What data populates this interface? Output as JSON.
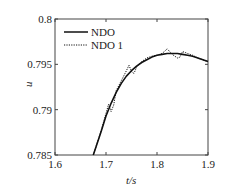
{
  "chart_data": {
    "type": "line",
    "title": "",
    "xlabel": "t/s",
    "ylabel": "u",
    "xlim": [
      1.6,
      1.9
    ],
    "ylim": [
      0.785,
      0.8
    ],
    "grid": false,
    "legend_position": "upper left",
    "x_ticks": [
      "1.6",
      "1.7",
      "1.8",
      "1.9"
    ],
    "y_ticks": [
      "0.785",
      "0.79",
      "0.795",
      "0.8"
    ],
    "series": [
      {
        "name": "NDO",
        "style": "solid",
        "x": [
          1.675,
          1.69,
          1.7,
          1.71,
          1.72,
          1.73,
          1.74,
          1.75,
          1.76,
          1.77,
          1.78,
          1.79,
          1.8,
          1.81,
          1.82,
          1.83,
          1.84,
          1.85,
          1.86,
          1.87,
          1.88,
          1.89,
          1.9
        ],
        "values": [
          0.785,
          0.7875,
          0.7893,
          0.7907,
          0.7919,
          0.7929,
          0.7937,
          0.7943,
          0.7948,
          0.7952,
          0.7955,
          0.7958,
          0.796,
          0.7961,
          0.7962,
          0.7962,
          0.7962,
          0.7961,
          0.796,
          0.7959,
          0.7957,
          0.7955,
          0.7953
        ]
      },
      {
        "name": "NDO 1",
        "style": "dotted",
        "x": [
          1.675,
          1.69,
          1.7,
          1.705,
          1.71,
          1.715,
          1.72,
          1.73,
          1.74,
          1.745,
          1.75,
          1.755,
          1.76,
          1.77,
          1.78,
          1.79,
          1.8,
          1.81,
          1.82,
          1.83,
          1.84,
          1.845,
          1.85,
          1.855,
          1.86,
          1.87,
          1.88,
          1.89,
          1.9
        ],
        "values": [
          0.785,
          0.7876,
          0.7896,
          0.7906,
          0.7898,
          0.7905,
          0.7921,
          0.7932,
          0.7943,
          0.7949,
          0.7942,
          0.794,
          0.7947,
          0.7953,
          0.7957,
          0.7959,
          0.796,
          0.7962,
          0.7967,
          0.7961,
          0.7957,
          0.7958,
          0.7964,
          0.7963,
          0.7962,
          0.796,
          0.7957,
          0.7955,
          0.7953
        ]
      }
    ]
  },
  "legend": {
    "items": [
      {
        "label": "NDO",
        "style": "solid"
      },
      {
        "label": "NDO 1",
        "style": "dotted"
      }
    ]
  },
  "colors": {
    "line": "#111111",
    "axis": "#333333"
  }
}
